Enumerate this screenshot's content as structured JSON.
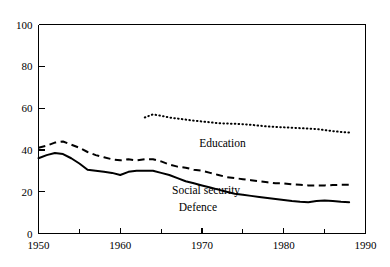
{
  "chart_data": {
    "type": "line",
    "title": "",
    "subtitle": "",
    "xlabel": "",
    "ylabel": "",
    "xlim": [
      1950,
      1990
    ],
    "ylim": [
      0,
      100
    ],
    "grid": false,
    "legend_position": "inline-annotations",
    "x_ticks_major": [
      1950,
      1960,
      1970,
      1980,
      1990
    ],
    "x_tick_labels": [
      "1950",
      "1960",
      "1970",
      "1980",
      "1990"
    ],
    "x_ticks_minor": [
      1955,
      1965,
      1975,
      1985
    ],
    "y_ticks": [
      0,
      20,
      40,
      60,
      80,
      100
    ],
    "y_tick_labels": [
      "0",
      "20",
      "40",
      "60",
      "80",
      "100"
    ],
    "series": [
      {
        "name": "Education",
        "style": "dotted",
        "x": [
          1963,
          1964,
          1965,
          1966,
          1967,
          1968,
          1969,
          1970,
          1971,
          1972,
          1973,
          1974,
          1975,
          1976,
          1977,
          1978,
          1979,
          1980,
          1981,
          1982,
          1983,
          1984,
          1985,
          1986,
          1987,
          1988
        ],
        "values": [
          55.5,
          57.0,
          56.3,
          55.5,
          55.0,
          54.5,
          54.0,
          53.6,
          53.2,
          52.8,
          52.6,
          52.5,
          52.3,
          52.0,
          51.6,
          51.2,
          51.0,
          50.8,
          50.6,
          50.4,
          50.2,
          50.0,
          49.5,
          49.0,
          48.6,
          48.3
        ]
      },
      {
        "name": "Social security",
        "style": "dashed",
        "x": [
          1950,
          1951,
          1952,
          1953,
          1954,
          1955,
          1956,
          1957,
          1958,
          1959,
          1960,
          1961,
          1962,
          1963,
          1964,
          1965,
          1966,
          1967,
          1968,
          1969,
          1970,
          1971,
          1972,
          1973,
          1974,
          1975,
          1976,
          1977,
          1978,
          1979,
          1980,
          1981,
          1982,
          1983,
          1984,
          1985,
          1986,
          1987,
          1988
        ],
        "values": [
          41.0,
          42.0,
          43.5,
          44.0,
          42.5,
          41.0,
          39.0,
          37.5,
          36.5,
          35.5,
          35.0,
          35.5,
          35.0,
          35.5,
          35.5,
          34.5,
          33.0,
          32.0,
          31.5,
          30.5,
          30.0,
          29.0,
          28.0,
          27.0,
          26.5,
          26.0,
          25.5,
          25.0,
          24.5,
          24.0,
          24.0,
          23.5,
          23.3,
          23.0,
          23.0,
          23.0,
          23.2,
          23.3,
          23.3
        ]
      },
      {
        "name": "Defence",
        "style": "solid",
        "x": [
          1950,
          1951,
          1952,
          1953,
          1954,
          1955,
          1956,
          1957,
          1958,
          1959,
          1960,
          1961,
          1962,
          1963,
          1964,
          1965,
          1966,
          1967,
          1968,
          1969,
          1970,
          1971,
          1972,
          1973,
          1974,
          1975,
          1976,
          1977,
          1978,
          1979,
          1980,
          1981,
          1982,
          1983,
          1984,
          1985,
          1986,
          1987,
          1988
        ],
        "values": [
          36.0,
          37.5,
          38.5,
          38.0,
          36.0,
          33.5,
          30.5,
          30.0,
          29.5,
          29.0,
          28.0,
          29.5,
          30.0,
          30.0,
          30.0,
          29.0,
          28.0,
          26.5,
          25.0,
          24.0,
          23.0,
          22.0,
          21.0,
          20.0,
          19.0,
          18.5,
          18.0,
          17.5,
          17.0,
          16.5,
          16.0,
          15.5,
          15.2,
          15.0,
          15.5,
          15.8,
          15.5,
          15.2,
          15.0
        ]
      }
    ],
    "annotations": [
      {
        "text": "Education",
        "x": 1972.5,
        "y": 41.5
      },
      {
        "text": "Social security",
        "x": 1970.5,
        "y": 19.0
      },
      {
        "text": "Defence",
        "x": 1969.5,
        "y": 11.0
      }
    ]
  }
}
